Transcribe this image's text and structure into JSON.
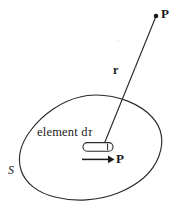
{
  "figure": {
    "canvas": {
      "width": 177,
      "height": 209,
      "background": "#ffffff"
    },
    "stroke_color": "#2b2b2b",
    "text_color": "#1a1a1a",
    "labels": {
      "field_point": "P",
      "distance_vector": "r",
      "element": "element d",
      "element_symbol": "τ",
      "polarization": "P",
      "surface": "S"
    },
    "elements": [
      {
        "name": "closed-surface-blob",
        "label": "S",
        "type": "closed-curve"
      },
      {
        "name": "volume-element-capsule",
        "label": "element dτ",
        "type": "capsule"
      },
      {
        "name": "polarization-arrow",
        "label": "P",
        "type": "arrow",
        "direction": "right"
      },
      {
        "name": "distance-vector-line",
        "label": "r",
        "type": "line"
      },
      {
        "name": "field-point-marker",
        "label": "P",
        "type": "dot"
      }
    ]
  }
}
